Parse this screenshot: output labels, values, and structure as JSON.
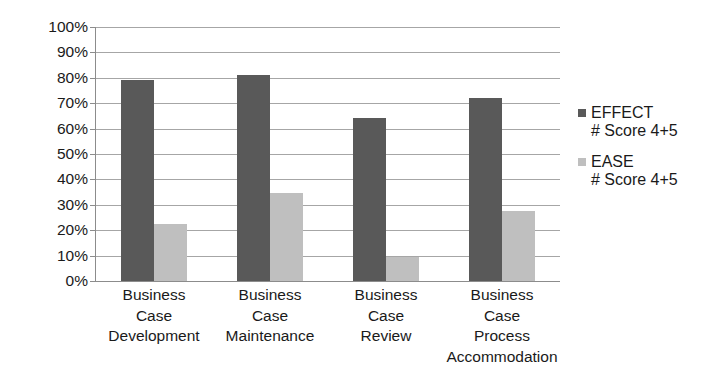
{
  "chart_data": {
    "type": "bar",
    "title": "",
    "subtitle": "",
    "xlabel": "",
    "ylabel": "",
    "ylim": [
      0,
      100
    ],
    "grid": true,
    "legend_position": "right",
    "y_ticks": [
      "100%",
      "90%",
      "80%",
      "70%",
      "60%",
      "50%",
      "40%",
      "30%",
      "20%",
      "10%",
      "0%"
    ],
    "y_tick_values": [
      100,
      90,
      80,
      70,
      60,
      50,
      40,
      30,
      20,
      10,
      0
    ],
    "categories": [
      "Business Case Development",
      "Business Case Maintenance",
      "Business Case Review",
      "Business Case Process Accommodation"
    ],
    "category_lines": [
      [
        "Business",
        "Case",
        "Development"
      ],
      [
        "Business",
        "Case",
        "Maintenance"
      ],
      [
        "Business",
        "Case",
        "Review"
      ],
      [
        "Business",
        "Case",
        "Process",
        "Accommodation"
      ]
    ],
    "series": [
      {
        "name": "EFFECT",
        "sub": "# Score 4+5",
        "color": "#595959",
        "values": [
          79,
          81,
          64,
          72
        ]
      },
      {
        "name": "EASE",
        "sub": "# Score 4+5",
        "color": "#bfbfbf",
        "values": [
          22.5,
          34.5,
          9.5,
          27.5
        ]
      }
    ]
  },
  "legend": {
    "entries": [
      {
        "name": "EFFECT",
        "sub": "# Score 4+5"
      },
      {
        "name": "EASE",
        "sub": "# Score 4+5"
      }
    ]
  },
  "colors": {
    "effect": "#595959",
    "ease": "#bfbfbf",
    "gridline": "#a6a6a6",
    "axis": "#8c8c8c",
    "background": "#ffffff",
    "text": "#1a1a1a"
  }
}
